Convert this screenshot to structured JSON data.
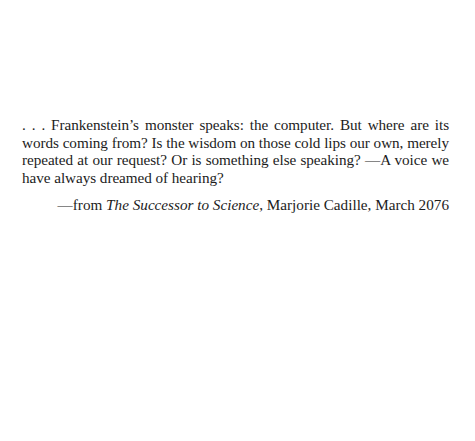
{
  "epigraph": {
    "text": ". . . Frankenstein’s monster speaks: the computer. But where are its words coming from? Is the wisdom on those cold lips our own, merely repeated at our request? Or is something else speaking? —A voice we have always dreamed of hearing?"
  },
  "attribution": {
    "prefix": "—from ",
    "work_title": "The Successor to Science",
    "suffix": ", Marjorie Cadille, March 2076"
  }
}
